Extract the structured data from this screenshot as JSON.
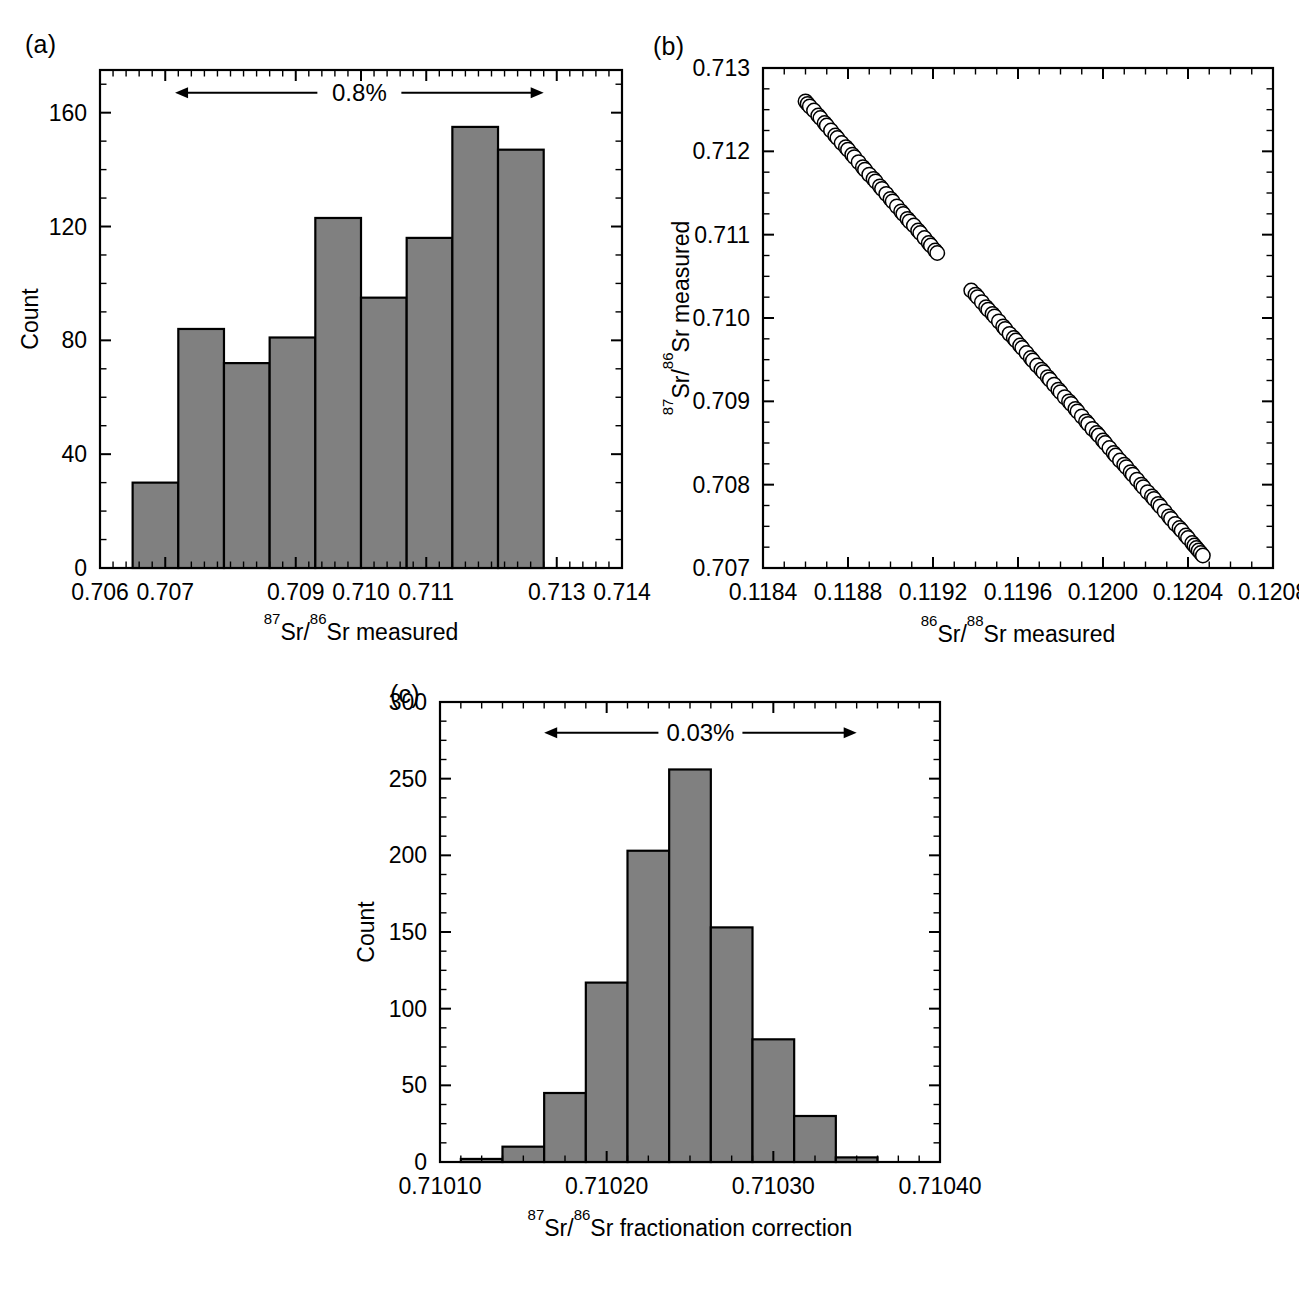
{
  "figure": {
    "panels": [
      "(a)",
      "(b)",
      "(c)"
    ]
  },
  "panel_a": {
    "label": "(a)",
    "annotation": "0.8%",
    "ylabel": "Count",
    "xlabel_parts": {
      "sup1": "87",
      "mid": "Sr/",
      "sup2": "86",
      "tail": "Sr measured"
    },
    "xlabel_text": "87Sr/86Sr measured",
    "xticklabels": [
      "0.706",
      "0.707",
      "0.709",
      "0.710",
      "0.711",
      "0.713",
      "0.714"
    ],
    "yticklabels": [
      "0",
      "40",
      "80",
      "120",
      "160"
    ]
  },
  "panel_b": {
    "label": "(b)",
    "ylabel_parts": {
      "sup1": "87",
      "mid": "Sr/",
      "sup2": "86",
      "tail": "Sr measured"
    },
    "ylabel_text": "87Sr/86Sr measured",
    "xlabel_parts": {
      "sup1": "86",
      "mid": "Sr/",
      "sup2": "88",
      "tail": "Sr measured"
    },
    "xlabel_text": "86Sr/88Sr measured",
    "xticklabels": [
      "0.1184",
      "0.1188",
      "0.1192",
      "0.1196",
      "0.1200",
      "0.1204",
      "0.1208"
    ],
    "yticklabels": [
      "0.707",
      "0.708",
      "0.709",
      "0.710",
      "0.711",
      "0.712",
      "0.713"
    ]
  },
  "panel_c": {
    "label": "(c)",
    "annotation": "0.03%",
    "ylabel": "Count",
    "xlabel_parts": {
      "sup1": "87",
      "mid": "Sr/",
      "sup2": "86",
      "tail": "Sr fractionation correction"
    },
    "xlabel_text": "87Sr/86Sr fractionation correction",
    "xticklabels": [
      "0.71010",
      "0.71020",
      "0.71030",
      "0.71040"
    ],
    "yticklabels": [
      "0",
      "50",
      "100",
      "150",
      "200",
      "250",
      "300"
    ]
  },
  "chart_data": [
    {
      "type": "bar",
      "panel": "(a)",
      "title": "",
      "xlabel": "87Sr/86Sr measured",
      "ylabel": "Count",
      "xlim": [
        0.706,
        0.714
      ],
      "ylim": [
        0,
        175
      ],
      "xticks": [
        0.706,
        0.707,
        0.709,
        0.71,
        0.711,
        0.713,
        0.714
      ],
      "xticklabels": [
        "0.706",
        "0.707",
        "0.709",
        "0.710",
        "0.711",
        "0.713",
        "0.714"
      ],
      "yticks": [
        0,
        40,
        80,
        120,
        160
      ],
      "yminor_step": 10,
      "grid": false,
      "bin_edges": [
        0.7065,
        0.7072,
        0.7079,
        0.7086,
        0.7093,
        0.71,
        0.7107,
        0.7114,
        0.7121,
        0.7128
      ],
      "categories": [
        "0.7065-0.7072",
        "0.7072-0.7079",
        "0.7079-0.7086",
        "0.7086-0.7093",
        "0.7093-0.7100",
        "0.7100-0.7107",
        "0.7107-0.7114",
        "0.7114-0.7121",
        "0.7121-0.7128"
      ],
      "values": [
        30,
        84,
        72,
        81,
        123,
        95,
        116,
        155,
        147
      ],
      "annotations": [
        {
          "text": "0.8%",
          "type": "double-arrow",
          "x_start": 0.70715,
          "x_end": 0.7128,
          "y": 167
        }
      ]
    },
    {
      "type": "scatter",
      "panel": "(b)",
      "title": "",
      "xlabel": "86Sr/88Sr measured",
      "ylabel": "87Sr/86Sr measured",
      "xlim": [
        0.1184,
        0.1208
      ],
      "ylim": [
        0.707,
        0.713
      ],
      "xticks": [
        0.1184,
        0.1188,
        0.1192,
        0.1196,
        0.12,
        0.1204,
        0.1208
      ],
      "yticks": [
        0.707,
        0.708,
        0.709,
        0.71,
        0.711,
        0.712,
        0.713
      ],
      "grid": false,
      "marker": "open-circle",
      "trend": "negative-linear",
      "fit": {
        "slope": -2820.0,
        "intercept": 1.04723
      },
      "x": [
        0.1186,
        0.11861,
        0.11862,
        0.11864,
        0.11866,
        0.11867,
        0.11869,
        0.1187,
        0.11872,
        0.11874,
        0.11875,
        0.11877,
        0.11879,
        0.1188,
        0.11882,
        0.11883,
        0.11885,
        0.11887,
        0.11888,
        0.1189,
        0.11892,
        0.11893,
        0.11895,
        0.11896,
        0.11898,
        0.119,
        0.11901,
        0.11903,
        0.11905,
        0.11906,
        0.11908,
        0.11909,
        0.11911,
        0.11913,
        0.11914,
        0.11916,
        0.11918,
        0.11919,
        0.11921,
        0.11922,
        0.11938,
        0.1194,
        0.11941,
        0.11943,
        0.11945,
        0.11946,
        0.11948,
        0.11949,
        0.11951,
        0.11953,
        0.11954,
        0.11956,
        0.11958,
        0.11959,
        0.11961,
        0.11962,
        0.11964,
        0.11966,
        0.11967,
        0.11969,
        0.11971,
        0.11972,
        0.11974,
        0.11975,
        0.11977,
        0.11979,
        0.1198,
        0.11982,
        0.11984,
        0.11985,
        0.11987,
        0.11988,
        0.1199,
        0.11992,
        0.11993,
        0.11995,
        0.11997,
        0.11998,
        0.12,
        0.12001,
        0.12003,
        0.12005,
        0.12006,
        0.12008,
        0.1201,
        0.12011,
        0.12013,
        0.12014,
        0.12016,
        0.12018,
        0.12019,
        0.12021,
        0.12023,
        0.12024,
        0.12026,
        0.12027,
        0.12029,
        0.12031,
        0.12032,
        0.12034,
        0.12036,
        0.12037,
        0.12039,
        0.1204,
        0.12042,
        0.12043,
        0.12044,
        0.12045,
        0.12046,
        0.12047
      ],
      "y": [
        0.7126,
        0.71257,
        0.71254,
        0.71249,
        0.71243,
        0.7124,
        0.71234,
        0.71231,
        0.71225,
        0.71219,
        0.71216,
        0.7121,
        0.71205,
        0.71202,
        0.71196,
        0.71193,
        0.71187,
        0.71181,
        0.71178,
        0.71172,
        0.71167,
        0.71164,
        0.71158,
        0.71155,
        0.71149,
        0.71143,
        0.7114,
        0.71134,
        0.71128,
        0.71125,
        0.71119,
        0.71116,
        0.71111,
        0.71105,
        0.71102,
        0.71096,
        0.7109,
        0.71087,
        0.71081,
        0.71078,
        0.71033,
        0.71028,
        0.71025,
        0.71019,
        0.71013,
        0.7101,
        0.71005,
        0.71002,
        0.70996,
        0.7099,
        0.70987,
        0.70981,
        0.70976,
        0.70973,
        0.70967,
        0.70964,
        0.70958,
        0.70952,
        0.70949,
        0.70943,
        0.70938,
        0.70935,
        0.70929,
        0.70926,
        0.7092,
        0.70914,
        0.70911,
        0.70905,
        0.709,
        0.70897,
        0.70891,
        0.70888,
        0.70882,
        0.70876,
        0.70873,
        0.70867,
        0.70862,
        0.70859,
        0.70853,
        0.7085,
        0.70844,
        0.70838,
        0.70835,
        0.70829,
        0.70824,
        0.70821,
        0.70815,
        0.70812,
        0.70806,
        0.708,
        0.70797,
        0.70791,
        0.70786,
        0.70783,
        0.70777,
        0.70774,
        0.70768,
        0.70762,
        0.70759,
        0.70753,
        0.70748,
        0.70745,
        0.70739,
        0.70736,
        0.7073,
        0.70727,
        0.70724,
        0.70721,
        0.70718,
        0.70715
      ]
    },
    {
      "type": "bar",
      "panel": "(c)",
      "title": "",
      "xlabel": "87Sr/86Sr fractionation correction",
      "ylabel": "Count",
      "xlim": [
        0.7101,
        0.7104
      ],
      "ylim": [
        0,
        300
      ],
      "xticks": [
        0.7101,
        0.7102,
        0.7103,
        0.7104
      ],
      "xticklabels": [
        "0.71010",
        "0.71020",
        "0.71030",
        "0.71040"
      ],
      "yticks": [
        0,
        50,
        100,
        150,
        200,
        250,
        300
      ],
      "yminor_step": 12.5,
      "grid": false,
      "bin_edges": [
        0.7101125,
        0.7101375,
        0.7101625,
        0.7101875,
        0.7102125,
        0.7102375,
        0.7102625,
        0.7102875,
        0.7103125,
        0.7103375,
        0.7103625
      ],
      "categories": [
        "0.710113-0.710138",
        "0.710138-0.710163",
        "0.710163-0.710188",
        "0.710188-0.710213",
        "0.710213-0.710238",
        "0.710238-0.710263",
        "0.710263-0.710288",
        "0.710288-0.710313",
        "0.710313-0.710338",
        "0.710338-0.710363"
      ],
      "values": [
        2,
        10,
        45,
        117,
        203,
        256,
        153,
        80,
        30,
        3
      ],
      "annotations": [
        {
          "text": "0.03%",
          "type": "double-arrow",
          "x_start": 0.7101625,
          "x_end": 0.71035,
          "y": 280
        }
      ]
    }
  ],
  "style": {
    "bar_fill": "#808080",
    "bar_stroke": "#000000",
    "axis_color": "#000000",
    "marker_fill": "#ffffff",
    "marker_stroke": "#000000",
    "background": "#ffffff"
  }
}
